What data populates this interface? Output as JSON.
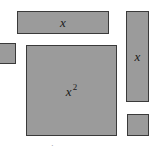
{
  "diagram": {
    "type": "algebra-tiles",
    "colors": {
      "tile_fill": "#9b9b9b",
      "tile_border": "#3a3a3a",
      "label": "#1a1a1a",
      "background": "#ffffff"
    },
    "tiles": [
      {
        "id": "x-tile-horizontal",
        "label": "x",
        "superscript": "",
        "left": 17,
        "top": 11,
        "width": 92,
        "height": 23
      },
      {
        "id": "unit-tile-left",
        "label": "",
        "superscript": "",
        "left": 0,
        "top": 43,
        "width": 16,
        "height": 21
      },
      {
        "id": "x-squared-tile",
        "label": "x",
        "superscript": "2",
        "left": 26,
        "top": 45,
        "width": 91,
        "height": 91
      },
      {
        "id": "x-tile-vertical",
        "label": "x",
        "superscript": "",
        "left": 126,
        "top": 11,
        "width": 23,
        "height": 91
      },
      {
        "id": "unit-tile-bottom-right",
        "label": "",
        "superscript": "",
        "left": 127,
        "top": 114,
        "width": 22,
        "height": 22
      }
    ],
    "bottom_mark": "·"
  }
}
